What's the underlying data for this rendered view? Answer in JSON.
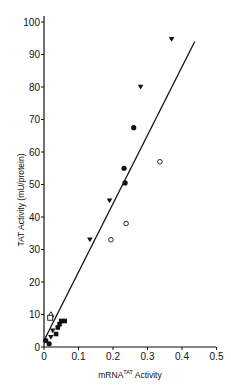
{
  "chart_data": {
    "type": "scatter",
    "title": "",
    "xlabel": "mRNA^TAT Activity",
    "xlabel_main": "mRNA",
    "xlabel_sup": "TAT",
    "xlabel_tail": " Activity",
    "ylabel": "TAT Activity (mU/protein)",
    "xlim": [
      0,
      0.5
    ],
    "ylim": [
      0,
      100
    ],
    "x_ticks": [
      "0",
      "0.1",
      "0.2",
      "0.3",
      "0.4",
      "0.5"
    ],
    "y_ticks": [
      "0",
      "10",
      "20",
      "30",
      "40",
      "50",
      "60",
      "70",
      "80",
      "90",
      "100"
    ],
    "grid": false,
    "legend": null,
    "series": [
      {
        "name": "filled-triangle",
        "marker": "triangle-down-filled",
        "points": [
          [
            0.37,
            94.7
          ],
          [
            0.28,
            80
          ],
          [
            0.19,
            45
          ],
          [
            0.133,
            33
          ],
          [
            0.025,
            5
          ],
          [
            0.02,
            3
          ]
        ]
      },
      {
        "name": "filled-circle",
        "marker": "circle-filled",
        "points": [
          [
            0.26,
            67.5
          ],
          [
            0.232,
            55
          ],
          [
            0.235,
            50.5
          ],
          [
            0.005,
            2
          ],
          [
            0.015,
            1
          ]
        ]
      },
      {
        "name": "open-circle",
        "marker": "circle-open",
        "points": [
          [
            0.336,
            57
          ],
          [
            0.238,
            38
          ],
          [
            0.194,
            33
          ]
        ]
      },
      {
        "name": "filled-square",
        "marker": "square-filled",
        "points": [
          [
            0.05,
            8
          ],
          [
            0.06,
            8
          ],
          [
            0.045,
            7
          ],
          [
            0.04,
            6
          ],
          [
            0.035,
            4
          ]
        ]
      },
      {
        "name": "open-triangle",
        "marker": "triangle-up-open",
        "points": [
          [
            0.02,
            10
          ]
        ]
      },
      {
        "name": "open-square",
        "marker": "square-open",
        "points": [
          [
            0.018,
            9
          ]
        ]
      }
    ],
    "fit_line": {
      "x": [
        0,
        0.437
      ],
      "y": [
        2,
        94
      ]
    }
  }
}
